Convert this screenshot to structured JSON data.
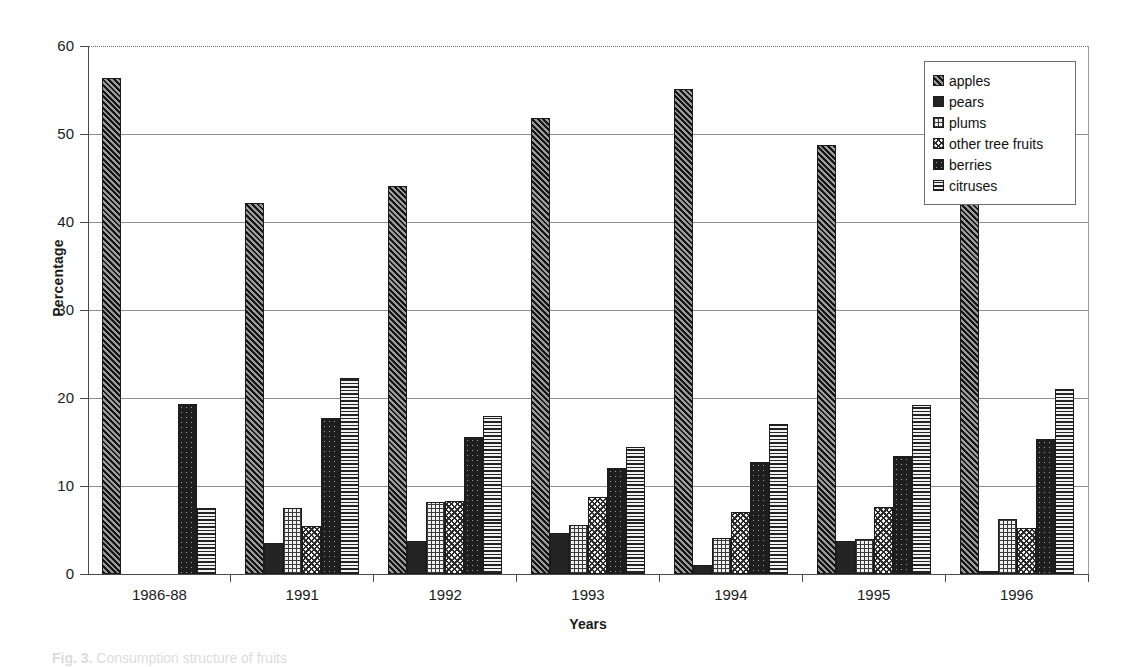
{
  "figure": {
    "caption_label": "Fig. 3.",
    "caption_text": "Consumption structure of fruits"
  },
  "chart_data": {
    "type": "bar",
    "title": "",
    "xlabel": "Years",
    "ylabel": "Percentage",
    "ylim": [
      0,
      60
    ],
    "yticks": [
      0,
      10,
      20,
      30,
      40,
      50,
      60
    ],
    "grid": true,
    "legend_position": "top-right",
    "categories": [
      "1986-88",
      "1991",
      "1992",
      "1993",
      "1994",
      "1995",
      "1996"
    ],
    "series": [
      {
        "name": "apples",
        "pattern": "diagonal-hatch-dark",
        "values": [
          56.4,
          42.2,
          44.1,
          51.8,
          55.1,
          48.8,
          47.4
        ]
      },
      {
        "name": "pears",
        "pattern": "solid-dark",
        "values": [
          0,
          3.5,
          3.7,
          4.7,
          1.0,
          3.8,
          0.3
        ]
      },
      {
        "name": "plums",
        "pattern": "light-grid",
        "values": [
          0,
          7.5,
          8.2,
          5.6,
          4.1,
          4.0,
          6.3
        ]
      },
      {
        "name": "other tree fruits",
        "pattern": "cross-hatch-light",
        "values": [
          0,
          5.5,
          8.3,
          8.7,
          7.1,
          7.6,
          5.2
        ]
      },
      {
        "name": "berries",
        "pattern": "dark-speckle",
        "values": [
          19.3,
          17.7,
          15.6,
          12.0,
          12.7,
          13.4,
          15.3
        ]
      },
      {
        "name": "citruses",
        "pattern": "horizontal-lines",
        "values": [
          7.5,
          22.3,
          17.9,
          14.4,
          17.0,
          19.2,
          21.0
        ]
      }
    ]
  }
}
